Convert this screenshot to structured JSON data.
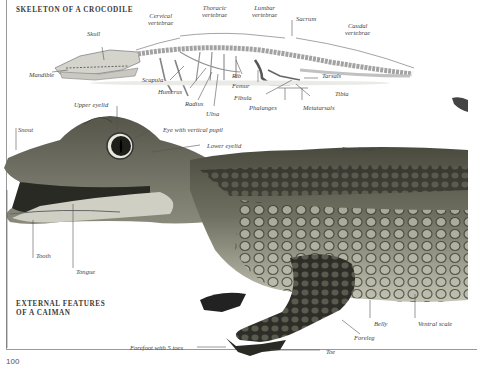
{
  "skeleton_section": {
    "title": "SKELETON OF A CROCODILE",
    "labels": {
      "skull": "Skull",
      "mandible": "Mandible",
      "cervical": [
        "Cervical",
        "vertebrae"
      ],
      "thoracic": [
        "Thoracic",
        "vertebrae"
      ],
      "lumbar": [
        "Lumbar",
        "vertebrae"
      ],
      "sacrum": "Sacrum",
      "caudal": [
        "Caudal",
        "vertebrae"
      ],
      "scapula": "Scapula",
      "humerus": "Humerus",
      "radius": "Radius",
      "ulna": "Ulna",
      "rib": "Rib",
      "femur": "Femur",
      "fibula": "Fibula",
      "tarsals": "Tarsals",
      "tibia": "Tibia",
      "phalanges": "Phalanges",
      "metatarsals": "Metatarsals"
    }
  },
  "caiman_section": {
    "title": [
      "EXTERNAL FEATURES",
      "OF A CAIMAN"
    ],
    "labels": {
      "upper_eyelid": "Upper eyelid",
      "snout": "Snout",
      "eye": "Eye with vertical pupil",
      "lower_eyelid": "Lower eyelid",
      "dorsal_scale": "Dorsal scale",
      "tooth": "Tooth",
      "tongue": "Tongue",
      "belly": "Belly",
      "ventral_scale": "Ventral scale",
      "foreleg": "Foreleg",
      "toe": "Toe",
      "forefoot": "Forefoot with 5 toes"
    }
  },
  "page_number": "100",
  "colors": {
    "skeleton": "#c8c8c0",
    "body_dark": "#3a3a30",
    "body_light": "#b8b8a8",
    "text": "#444444"
  }
}
